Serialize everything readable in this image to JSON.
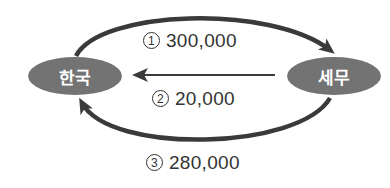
{
  "colors": {
    "node_fill": "#737373",
    "arrow": "#3a3a3a",
    "text": "#333333",
    "node_text": "#ffffff"
  },
  "nodes": [
    {
      "id": "korea",
      "label": "한국"
    },
    {
      "id": "semu",
      "label": "세무"
    }
  ],
  "flows": [
    {
      "number": "1",
      "circled": "①",
      "value": "300,000",
      "from": "한국",
      "to": "세무",
      "path": "top-arc"
    },
    {
      "number": "2",
      "circled": "②",
      "value": "20,000",
      "from": "세무",
      "to": "한국",
      "path": "straight"
    },
    {
      "number": "3",
      "circled": "③",
      "value": "280,000",
      "from": "세무",
      "to": "한국",
      "path": "bottom-arc"
    }
  ]
}
